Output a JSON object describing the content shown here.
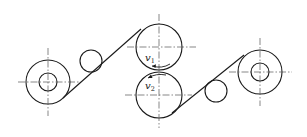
{
  "diagram": {
    "title": "",
    "colors": {
      "stroke": "#1a1a1a",
      "centerline": "#555555",
      "background": "#ffffff"
    },
    "rollers": {
      "unwind": {
        "cx": 48,
        "cy": 82,
        "r_outer": 22,
        "r_inner": 9
      },
      "left_idler": {
        "cx": 91,
        "cy": 61,
        "r": 11
      },
      "upper_roller": {
        "cx": 159,
        "cy": 47,
        "r": 23
      },
      "lower_roller": {
        "cx": 159,
        "cy": 95,
        "r": 23
      },
      "right_idler": {
        "cx": 216,
        "cy": 91,
        "r": 11
      },
      "rewind": {
        "cx": 260,
        "cy": 72,
        "r_outer": 22,
        "r_inner": 9
      }
    },
    "labels": {
      "v1": {
        "main": "v",
        "sub": "1"
      },
      "v2": {
        "main": "v",
        "sub": "2"
      }
    }
  }
}
